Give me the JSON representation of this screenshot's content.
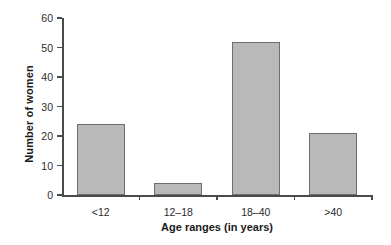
{
  "chart_data": {
    "type": "bar",
    "title": "",
    "xlabel": "Age ranges (in years)",
    "ylabel": "Number of women",
    "categories": [
      "<12",
      "12–18",
      "18–40",
      ">40"
    ],
    "values": [
      24,
      4,
      52,
      21
    ],
    "ylim": [
      0,
      60
    ],
    "yticks": [
      0,
      10,
      20,
      30,
      40,
      50,
      60
    ],
    "ytick_labels": [
      "0",
      "10",
      "20",
      "30",
      "40",
      "50",
      "60"
    ],
    "grid": false,
    "legend": false,
    "bar_color": "#b9b9b9",
    "bar_edge_color": "#6e6e6e",
    "axis_color": "#4a4a4a",
    "background": "#ffffff"
  }
}
